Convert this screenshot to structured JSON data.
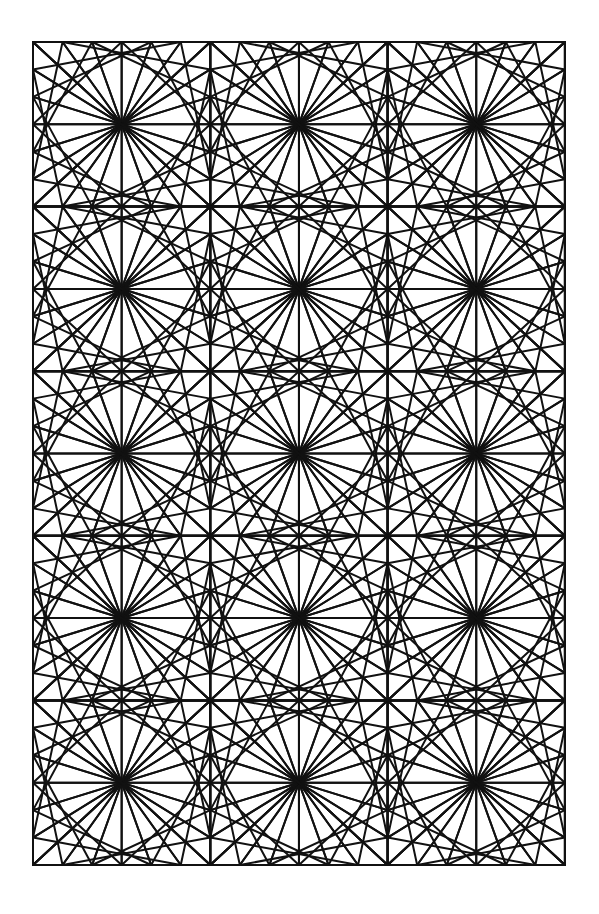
{
  "artwork": {
    "title": "Curve-Stitch Geometric Line Pattern",
    "type": "line-art",
    "medium": "string-art / curve stitching",
    "stroke_color": "#111111",
    "background_color": "#ffffff",
    "stroke_width": 2,
    "canvas": {
      "width": 599,
      "height": 914
    }
  },
  "grid": {
    "columns": 3,
    "rows": 5,
    "x_positions": [
      33,
      210.3,
      387.6,
      564.9
    ],
    "y_positions": [
      42,
      206.6,
      371.2,
      535.8,
      700.4,
      865
    ],
    "cell_width": 177.3,
    "cell_height": 164.6,
    "border_drawn": true
  },
  "cell_construction": {
    "description": "Each identical cell is built from straight chords joining evenly spaced division points on its edges, producing parabolic envelopes that meet at the four corners.",
    "divisions_per_edge": 6,
    "families": [
      {
        "name": "top-left-corner-fan",
        "from_edge": "left",
        "to_edge": "top",
        "reversed": true
      },
      {
        "name": "top-right-corner-fan",
        "from_edge": "right",
        "to_edge": "top",
        "reversed": true
      },
      {
        "name": "bottom-left-corner-fan",
        "from_edge": "left",
        "to_edge": "bottom",
        "reversed": true
      },
      {
        "name": "bottom-right-corner-fan",
        "from_edge": "right",
        "to_edge": "bottom",
        "reversed": true
      },
      {
        "name": "top-to-bottom-left-lean",
        "from_edge": "top",
        "to_edge": "bottom",
        "reversed": true
      },
      {
        "name": "left-to-right-cross",
        "from_edge": "left",
        "to_edge": "right",
        "reversed": true
      }
    ],
    "symmetry": [
      "vertical-mirror",
      "horizontal-mirror"
    ],
    "convergence_nodes": "grid intersections where all cell fans meet in a star"
  },
  "chart_data": {
    "type": "line",
    "title": "Curve-Stitch Geometric Line Pattern",
    "xlabel": "",
    "ylabel": "",
    "grid": false,
    "legend": "none",
    "xlim": [
      33,
      565
    ],
    "ylim": [
      42,
      865
    ],
    "categories": [
      "row-1",
      "row-2",
      "row-3",
      "row-4",
      "row-5"
    ],
    "values": [
      3,
      3,
      3,
      3,
      3
    ],
    "annotations": [
      "3 columns x 5 rows of identical curve-stitch tiles",
      "6 subdivisions per tile edge",
      "straight chords only; curves are envelopes"
    ]
  }
}
